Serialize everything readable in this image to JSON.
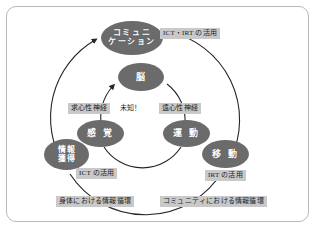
{
  "diagram": {
    "title": "",
    "type": "cycle-diagram",
    "frame": {
      "shape": "rounded-rectangle",
      "border_color": "#b9b9b9"
    },
    "palette": {
      "node_fill": "#6b6b6b",
      "node_text": "#ffffff",
      "tag_fill": "#c9c9c9",
      "tag_text": "#1c1c1c",
      "arc_color": "#262626",
      "background": "#ffffff"
    },
    "nodes": [
      {
        "id": "communication",
        "label": "コミュニケーション",
        "line1": "コミュニ",
        "line2": "ケーション"
      },
      {
        "id": "brain",
        "label": "脳"
      },
      {
        "id": "sense",
        "label": "感 覚"
      },
      {
        "id": "motion",
        "label": "運 動"
      },
      {
        "id": "info_acquisition",
        "label": "情報獲得",
        "line1": "情報",
        "line2": "獲得"
      },
      {
        "id": "locomotion",
        "label": "移 動"
      }
    ],
    "tags": [
      {
        "id": "ict_irt",
        "label": "ICT・IRT の活用",
        "style": "boxed"
      },
      {
        "id": "afferent",
        "label": "求心性神経",
        "style": "boxed"
      },
      {
        "id": "efferent",
        "label": "遠心性神経",
        "style": "boxed"
      },
      {
        "id": "unknown",
        "label": "未知！",
        "style": "plain"
      },
      {
        "id": "ict",
        "label": "ICT の活用",
        "style": "boxed"
      },
      {
        "id": "irt",
        "label": "IRT の活用",
        "style": "boxed"
      },
      {
        "id": "body_loop",
        "label": "身体における情報循環",
        "style": "boxed"
      },
      {
        "id": "community_loop",
        "label": "コミュニティにおける情報循環",
        "style": "boxed"
      }
    ],
    "arcs": [
      {
        "id": "inner-loop",
        "description": "inner circle connecting brain, sense and motion"
      },
      {
        "id": "outer-loop",
        "description": "outer circle connecting communication, information acquisition and locomotion"
      }
    ]
  }
}
